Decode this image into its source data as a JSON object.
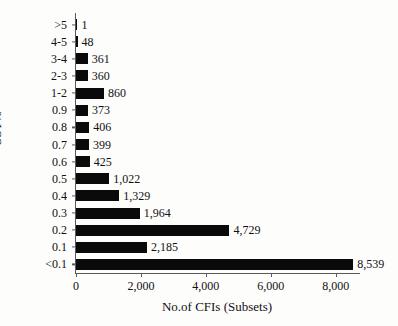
{
  "chart_data": {
    "type": "bar",
    "orientation": "horizontal",
    "title": "",
    "xlabel": "No.of CFIs (Subsets)",
    "ylabel": "SST%",
    "categories": [
      ">5",
      "4-5",
      "3-4",
      "2-3",
      "1-2",
      "0.9",
      "0.8",
      "0.7",
      "0.6",
      "0.5",
      "0.4",
      "0.3",
      "0.2",
      "0.1",
      "<0.1"
    ],
    "values": [
      1,
      48,
      361,
      360,
      860,
      373,
      406,
      399,
      425,
      1022,
      1329,
      1964,
      4729,
      2185,
      8539
    ],
    "value_labels": [
      "1",
      "48",
      "361",
      "360",
      "860",
      "373",
      "406",
      "399",
      "425",
      "1,022",
      "1,329",
      "1,964",
      "4,729",
      "2,185",
      "8,539"
    ],
    "xlim": [
      0,
      8750
    ],
    "xticks": [
      0,
      2000,
      4000,
      6000,
      8000
    ],
    "xtick_labels": [
      "0",
      "2,000",
      "4,000",
      "6,000",
      "8,000"
    ],
    "grid": false,
    "legend": false,
    "bar_color": "#0a0a0a",
    "axis_color": "#5a5a58",
    "background": "#fdfdfc"
  }
}
